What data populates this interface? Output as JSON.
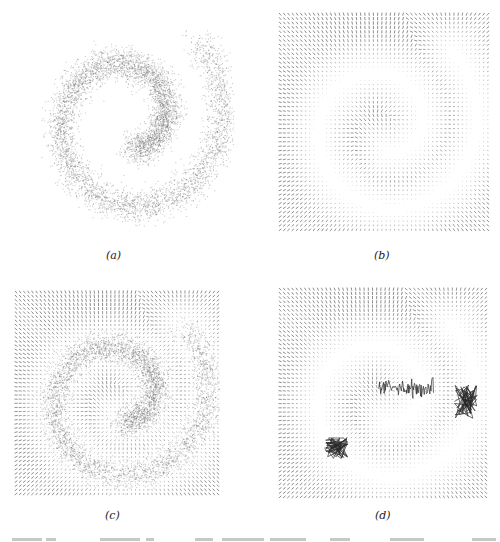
{
  "figure": {
    "panels": [
      {
        "id": "a",
        "caption": "(a)",
        "kind": "samples",
        "left": 20,
        "top": 0,
        "width": 215,
        "height": 230,
        "caption_x": 114,
        "caption_y": 249
      },
      {
        "id": "b",
        "caption": "(b)",
        "kind": "field",
        "left": 278,
        "top": 12,
        "width": 212,
        "height": 220,
        "caption_x": 382,
        "caption_y": 249
      },
      {
        "id": "c",
        "caption": "(c)",
        "kind": "field+samples",
        "left": 14,
        "top": 290,
        "width": 206,
        "height": 206,
        "caption_x": 113,
        "caption_y": 509
      },
      {
        "id": "d",
        "caption": "(d)",
        "kind": "field+trajectories",
        "left": 278,
        "top": 287,
        "width": 210,
        "height": 212,
        "caption_x": 383,
        "caption_y": 509
      }
    ]
  },
  "chart_data": [
    {
      "type": "scatter",
      "title": "(a)",
      "description": "Samples from a 2D spiral (swiss-roll) distribution",
      "spiral": {
        "center": [
          0.5,
          0.52
        ],
        "turns": 1.35,
        "r_start": 0.12,
        "r_end": 0.47,
        "theta_start_deg": 100,
        "noise": 0.035,
        "n_points": 6000
      },
      "xlabel": "",
      "ylabel": "",
      "grid": false
    },
    {
      "type": "quiver",
      "title": "(b)",
      "description": "Learned score / vector field on a 50x50 grid, arrows point toward the data manifold",
      "grid_size": 50,
      "arrow_color": "#555555"
    },
    {
      "type": "quiver",
      "title": "(c)",
      "description": "Vector field overlaid with spiral samples",
      "grid_size": 50,
      "arrow_color": "#555555"
    },
    {
      "type": "quiver",
      "title": "(d)",
      "description": "Vector field with sampled trajectories (dark clusters)",
      "grid_size": 50,
      "arrow_color": "#555555",
      "trajectory_clusters": [
        {
          "x": [
            0.48,
            0.74
          ],
          "y": [
            0.46,
            0.5
          ],
          "shape": "trail"
        },
        {
          "x": [
            0.84,
            0.95
          ],
          "y": [
            0.46,
            0.62
          ],
          "shape": "blob"
        },
        {
          "x": [
            0.22,
            0.34
          ],
          "y": [
            0.71,
            0.81
          ],
          "shape": "blob"
        }
      ]
    }
  ],
  "footer": {
    "clipped_caption_text": ""
  }
}
